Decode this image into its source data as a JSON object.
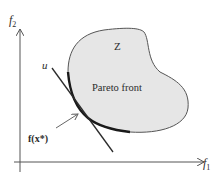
{
  "figure": {
    "type": "pareto-front-diagram",
    "axes": {
      "x_label": "f",
      "x_label_sub": "1",
      "y_label": "f",
      "y_label_sub": "2"
    },
    "region_label": "Z",
    "front_label": "Pareto front",
    "tangent_label": "u",
    "point_label": "f(x*)",
    "colors": {
      "region_fill": "#e6e6e6",
      "outline": "#555555",
      "front": "#1a1a1a",
      "axes": "#555555",
      "text": "#2b2b2b"
    }
  }
}
